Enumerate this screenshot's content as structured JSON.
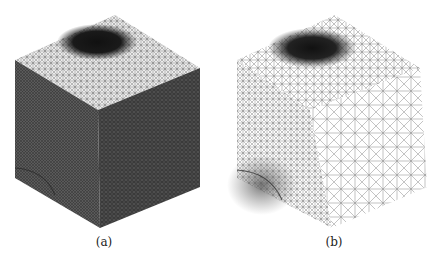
{
  "figure": {
    "panels": [
      {
        "label": "(a)",
        "description": "Tetrahedral mesh of a cube, dense unstructured mesh with refined region on top face and bottom-left of front face"
      },
      {
        "label": "(b)",
        "description": "Tetrahedral mesh of a cube, structured/adaptive mesh coarser on right face with refinement on top face and bottom-left of front face"
      }
    ]
  }
}
